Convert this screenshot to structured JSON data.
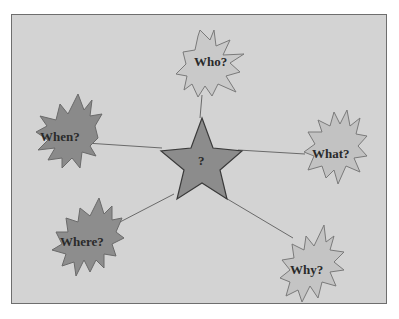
{
  "diagram": {
    "type": "mind-map",
    "center": {
      "label": "?",
      "shape": "five-point-star",
      "fill": "#8c8c8c",
      "stroke": "#3a3a3a"
    },
    "nodes": [
      {
        "id": "who",
        "label": "Who?",
        "shape": "explosion",
        "fill": "#c9c9c9",
        "stroke": "#7a7a7a"
      },
      {
        "id": "what",
        "label": "What?",
        "shape": "explosion",
        "fill": "#c2c2c2",
        "stroke": "#7a7a7a"
      },
      {
        "id": "why",
        "label": "Why?",
        "shape": "explosion",
        "fill": "#c4c4c4",
        "stroke": "#7a7a7a"
      },
      {
        "id": "where",
        "label": "Where?",
        "shape": "explosion",
        "fill": "#8d8d8d",
        "stroke": "#6a6a6a"
      },
      {
        "id": "when",
        "label": "When?",
        "shape": "explosion",
        "fill": "#8a8a8a",
        "stroke": "#6a6a6a"
      }
    ],
    "background": "#d3d3d3",
    "border": "#6e6e6e"
  }
}
